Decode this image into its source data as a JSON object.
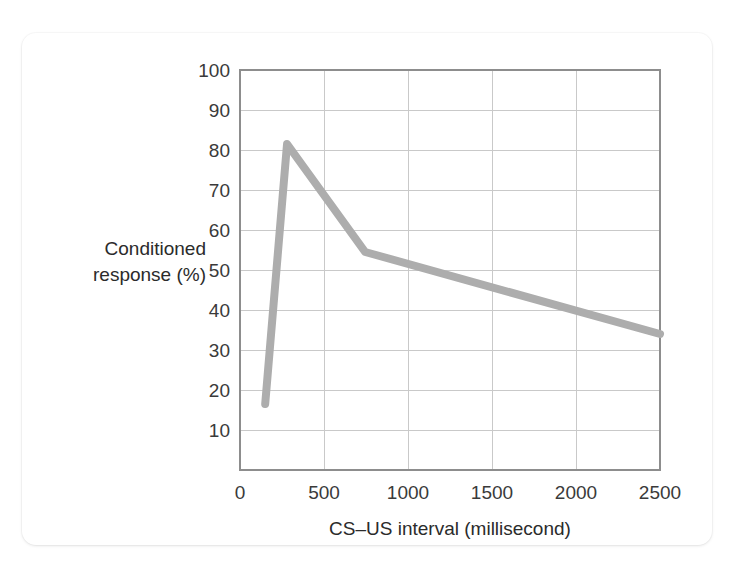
{
  "figure": {
    "background_color": "#ffffff",
    "card_color": "#ffffff"
  },
  "chart_data": {
    "type": "line",
    "title": "",
    "subtitle": "",
    "xlabel": "CS–US interval (millisecond)",
    "ylabel": "Conditioned response (%)",
    "ylabel_lines": [
      "Conditioned",
      "response (%)"
    ],
    "xlim": [
      0,
      2500
    ],
    "ylim": [
      0,
      100
    ],
    "xticks": [
      0,
      500,
      1000,
      1500,
      2000,
      2500
    ],
    "xticklabels": [
      "0",
      "500",
      "1000",
      "1500",
      "2000",
      "2500"
    ],
    "yticks": [
      10,
      20,
      30,
      40,
      50,
      60,
      70,
      80,
      90,
      100
    ],
    "yticklabels": [
      "10",
      "20",
      "30",
      "40",
      "50",
      "60",
      "70",
      "80",
      "90",
      "100"
    ],
    "grid": true,
    "grid_color": "#c9c9c9",
    "legend": false,
    "legend_position": "none",
    "line_color": "#adadad",
    "line_width": 8,
    "markers": false,
    "series": [
      {
        "name": "Conditioned response",
        "x": [
          150,
          280,
          745,
          2500
        ],
        "values": [
          16.5,
          81.5,
          54.5,
          34
        ]
      }
    ]
  }
}
